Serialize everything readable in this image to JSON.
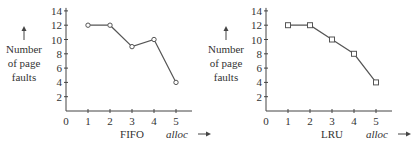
{
  "chart_data": [
    {
      "type": "line",
      "title": "FIFO",
      "xlabel": "alloc",
      "ylabel": "Number of page faults",
      "x": [
        1,
        2,
        3,
        4,
        5
      ],
      "values": [
        12,
        12,
        9,
        10,
        4
      ],
      "marker": "circle",
      "xticks": [
        0,
        1,
        2,
        3,
        4,
        5
      ],
      "yticks": [
        2,
        4,
        6,
        8,
        10,
        12,
        14
      ],
      "xlim": [
        0,
        6
      ],
      "ylim": [
        0,
        14
      ],
      "grid": false
    },
    {
      "type": "line",
      "title": "LRU",
      "xlabel": "alloc",
      "ylabel": "Number of page faults",
      "x": [
        1,
        2,
        3,
        4,
        5
      ],
      "values": [
        12,
        12,
        10,
        8,
        4
      ],
      "marker": "square",
      "xticks": [
        0,
        1,
        2,
        3,
        4,
        5
      ],
      "yticks": [
        2,
        4,
        6,
        8,
        10,
        12,
        14
      ],
      "xlim": [
        0,
        6
      ],
      "ylim": [
        0,
        14
      ],
      "grid": false
    }
  ],
  "labels": {
    "ylabel_line1": "Number",
    "ylabel_line2": "of page",
    "ylabel_line3": "faults",
    "xlabel": "alloc",
    "origin": "0"
  },
  "colors": {
    "line": "#555555",
    "axis": "#444444",
    "text": "#333333"
  }
}
